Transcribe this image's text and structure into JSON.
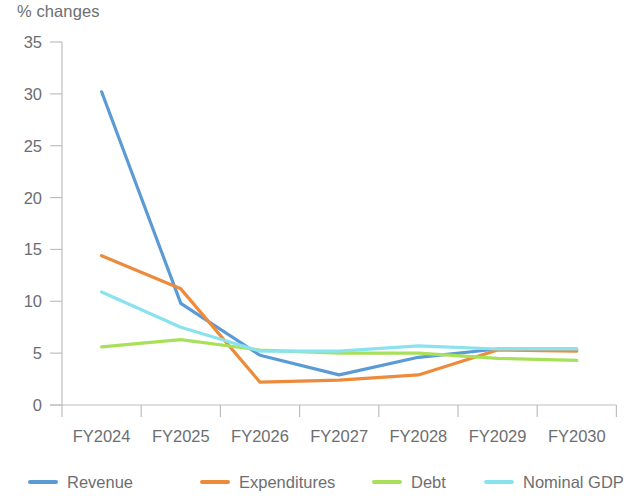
{
  "chart_data": {
    "type": "line",
    "title": "",
    "ylabel": "% changes",
    "xlabel": "",
    "categories": [
      "FY2024",
      "FY2025",
      "FY2026",
      "FY2027",
      "FY2028",
      "FY2029",
      "FY2030"
    ],
    "ylim": [
      0,
      35
    ],
    "yticks": [
      0,
      5,
      10,
      15,
      20,
      25,
      30,
      35
    ],
    "grid": false,
    "legend_position": "bottom",
    "series": [
      {
        "name": "Revenue",
        "color": "#5b9bd5",
        "values": [
          30.2,
          9.8,
          4.8,
          2.9,
          4.6,
          5.4,
          5.4
        ]
      },
      {
        "name": "Expenditures",
        "color": "#ed8b3c",
        "values": [
          14.4,
          11.2,
          2.2,
          2.4,
          2.9,
          5.3,
          5.2
        ]
      },
      {
        "name": "Debt",
        "color": "#a8e05a",
        "values": [
          5.6,
          6.3,
          5.3,
          5.0,
          5.0,
          4.5,
          4.3
        ]
      },
      {
        "name": "Nominal GDP",
        "color": "#89e3ef",
        "values": [
          10.9,
          7.5,
          5.2,
          5.2,
          5.7,
          5.4,
          5.4
        ]
      }
    ]
  },
  "axis": {
    "ytick_labels": [
      "35",
      "30",
      "25",
      "20",
      "15",
      "10",
      "5",
      "0"
    ],
    "xtick_labels": [
      "FY2024",
      "FY2025",
      "FY2026",
      "FY2027",
      "FY2028",
      "FY2029",
      "FY2030"
    ]
  },
  "legend": {
    "items": [
      {
        "label": "Revenue",
        "color": "#5b9bd5"
      },
      {
        "label": "Expenditures",
        "color": "#ed8b3c"
      },
      {
        "label": "Debt",
        "color": "#a8e05a"
      },
      {
        "label": "Nominal GDP",
        "color": "#89e3ef"
      }
    ]
  },
  "colors": {
    "axis": "#bcbec0",
    "text": "#6d6e71",
    "background": "#ffffff"
  }
}
